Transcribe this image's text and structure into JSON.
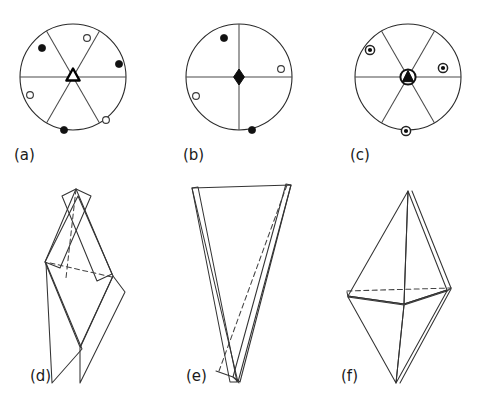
{
  "figure": {
    "width": 479,
    "height": 401,
    "background": "#ffffff",
    "ink_color": "#2b2b2b",
    "caption_color": "#1a1a1a"
  },
  "panels": [
    {
      "id": "a",
      "label": "(a)",
      "label_x": 14,
      "label_y": 160,
      "kind": "stereogram",
      "center_x": 73,
      "center_y": 77,
      "radius": 53,
      "sector_count": 6,
      "center_symbol": "open-triangle-3fold-axis",
      "diameter_angles_deg": [
        0,
        60,
        120
      ],
      "points": [
        {
          "symbol": "filled-circle",
          "x": 42,
          "y": 48,
          "r": 3.6
        },
        {
          "symbol": "open-circle",
          "x": 87,
          "y": 38,
          "r": 3.4
        },
        {
          "symbol": "filled-circle",
          "x": 119,
          "y": 64,
          "r": 3.6
        },
        {
          "symbol": "open-circle",
          "x": 30,
          "y": 95,
          "r": 3.4
        },
        {
          "symbol": "filled-circle",
          "x": 64,
          "y": 130,
          "r": 3.6
        },
        {
          "symbol": "open-circle",
          "x": 106,
          "y": 120,
          "r": 3.4
        }
      ]
    },
    {
      "id": "b",
      "label": "(b)",
      "label_x": 183,
      "label_y": 160,
      "kind": "stereogram",
      "center_x": 239,
      "center_y": 77,
      "radius": 53,
      "sector_count": 4,
      "center_symbol": "filled-lens-2fold-axis",
      "diameter_angles_deg": [
        0,
        90
      ],
      "points": [
        {
          "symbol": "filled-circle",
          "x": 224,
          "y": 38,
          "r": 3.6
        },
        {
          "symbol": "open-circle",
          "x": 281,
          "y": 69,
          "r": 3.4
        },
        {
          "symbol": "open-circle",
          "x": 196,
          "y": 96,
          "r": 3.4
        },
        {
          "symbol": "filled-circle",
          "x": 252,
          "y": 130,
          "r": 3.6
        }
      ]
    },
    {
      "id": "c",
      "label": "(c)",
      "label_x": 350,
      "label_y": 160,
      "kind": "stereogram",
      "center_x": 408,
      "center_y": 77,
      "radius": 53,
      "sector_count": 6,
      "center_symbol": "filled-triangle-in-circle-inversion-triad",
      "diameter_angles_deg": [
        0,
        60,
        120
      ],
      "points": [
        {
          "symbol": "dot-in-circle",
          "x": 370,
          "y": 50,
          "r": 4.6
        },
        {
          "symbol": "dot-in-circle",
          "x": 443,
          "y": 68,
          "r": 4.6
        },
        {
          "symbol": "dot-in-circle",
          "x": 406,
          "y": 131,
          "r": 4.6
        }
      ]
    },
    {
      "id": "d",
      "label": "(d)",
      "label_x": 30,
      "label_y": 381,
      "kind": "crystal-form",
      "form_name": "rhombohedron"
    },
    {
      "id": "e",
      "label": "(e)",
      "label_x": 186,
      "label_y": 381,
      "kind": "crystal-form",
      "form_name": "elongated-tetrahedron"
    },
    {
      "id": "f",
      "label": "(f)",
      "label_x": 341,
      "label_y": 381,
      "kind": "crystal-form",
      "form_name": "bipyramid"
    }
  ],
  "legend": {
    "filled_circle_meaning": "filled-circle",
    "open_circle_meaning": "open-circle",
    "dot_in_circle_meaning": "dot-in-circle"
  }
}
